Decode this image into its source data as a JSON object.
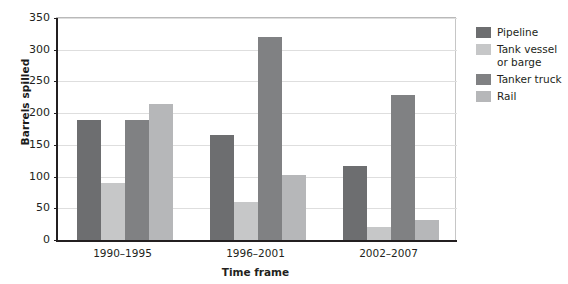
{
  "chart_data": {
    "type": "bar",
    "title": "",
    "xlabel": "Time frame",
    "ylabel": "Barrels spilled",
    "categories": [
      "1990–1995",
      "1996–2001",
      "2002–2007"
    ],
    "series": [
      {
        "name": "Pipeline",
        "color": "#6d6e70",
        "values": [
          190,
          165,
          117
        ]
      },
      {
        "name": "Tank vessel\nor barge",
        "color": "#c6c7c8",
        "values": [
          90,
          60,
          20
        ]
      },
      {
        "name": "Tanker truck",
        "color": "#808183",
        "values": [
          190,
          320,
          228
        ]
      },
      {
        "name": "Rail",
        "color": "#b6b7b9",
        "values": [
          215,
          103,
          31
        ]
      }
    ],
    "ylim": [
      0,
      350
    ],
    "yticks": [
      0,
      50,
      100,
      150,
      200,
      250,
      300,
      350
    ],
    "ytick_labels": [
      "0",
      "50",
      "100",
      "150",
      "200",
      "250",
      "300",
      "350"
    ],
    "grid": true,
    "legend_position": "right"
  },
  "axes": {
    "y_title": "Barrels spilled",
    "x_title": "Time frame"
  },
  "legend": {
    "entries": [
      {
        "label": "Pipeline",
        "color": "#6d6e70"
      },
      {
        "label": "Tank vessel\nor barge",
        "color": "#c6c7c8"
      },
      {
        "label": "Tanker truck",
        "color": "#808183"
      },
      {
        "label": "Rail",
        "color": "#b6b7b9"
      }
    ]
  }
}
